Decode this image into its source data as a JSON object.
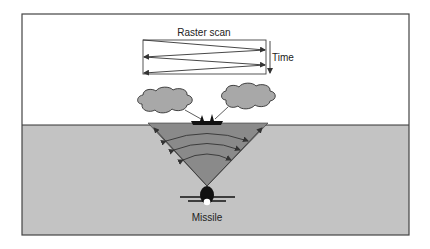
{
  "diagram": {
    "title": "Raster scan",
    "time_label": "Time",
    "missile_label": "Missile",
    "colors": {
      "sky": "#ffffff",
      "sea": "#c3c3c3",
      "beam": "#8a8a8a",
      "cloud": "#a8a8a8",
      "outline": "#333333",
      "frame": "#444444"
    },
    "elements": [
      "frame",
      "raster-scan-box",
      "time-arrow",
      "cloud-left",
      "cloud-right",
      "ship",
      "seeker-beam",
      "wavefront-arcs",
      "missile"
    ]
  }
}
